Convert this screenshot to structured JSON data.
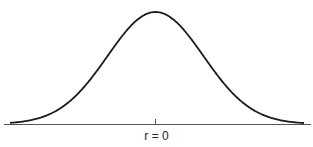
{
  "chart_data": {
    "type": "line",
    "title": "",
    "xlabel": "",
    "ylabel": "",
    "x_tick_labels": [
      "r = 0"
    ],
    "grid": false,
    "legend": null,
    "series": [
      {
        "name": "sampling distribution",
        "distribution": "normal",
        "mean": 0,
        "x": [
          -3,
          -2.5,
          -2,
          -1.5,
          -1,
          -0.5,
          0,
          0.5,
          1,
          1.5,
          2,
          2.5,
          3
        ],
        "values": [
          0.004,
          0.018,
          0.054,
          0.13,
          0.242,
          0.352,
          0.399,
          0.352,
          0.242,
          0.13,
          0.054,
          0.018,
          0.004
        ]
      }
    ],
    "colors": {
      "curve": "#1a1a1a",
      "axis": "#555555"
    }
  },
  "axis": {
    "center_label": "r = 0"
  }
}
